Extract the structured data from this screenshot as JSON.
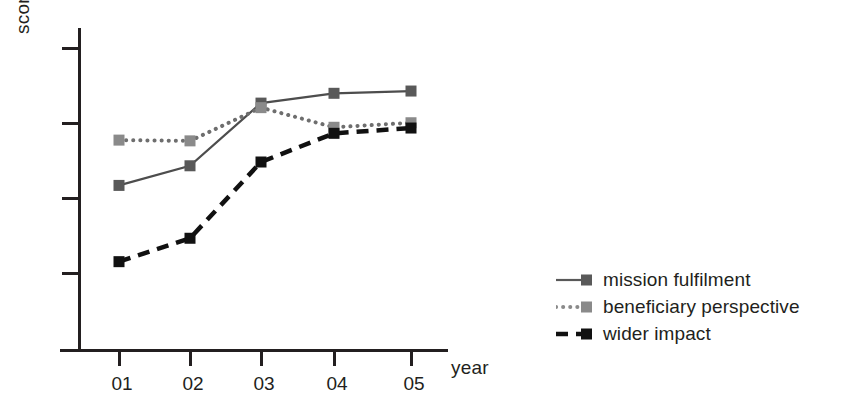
{
  "chart_data": {
    "type": "line",
    "title": "",
    "xlabel": "year",
    "ylabel": "score",
    "categories": [
      "01",
      "02",
      "03",
      "04",
      "05"
    ],
    "x": [
      1,
      2,
      3,
      4,
      5
    ],
    "ylim": [
      0,
      4
    ],
    "xlim": [
      0.5,
      5.6
    ],
    "grid": false,
    "y_ticks_labeled": false,
    "y_tick_count": 4,
    "legend_position": "right",
    "series": [
      {
        "name": "mission fulfilment",
        "values": [
          2.18,
          2.44,
          3.27,
          3.4,
          3.43
        ],
        "color": "#4d4d4d",
        "marker_color": "#595959",
        "line_style": "solid"
      },
      {
        "name": "beneficiary perspective",
        "values": [
          2.78,
          2.77,
          3.21,
          2.95,
          3.01
        ],
        "color": "#6e6e6e",
        "marker_color": "#8a8a8a",
        "line_style": "dotted"
      },
      {
        "name": "wider impact",
        "values": [
          1.17,
          1.48,
          2.49,
          2.87,
          2.94
        ],
        "color": "#111111",
        "marker_color": "#111111",
        "line_style": "dashed"
      }
    ]
  },
  "axes": {
    "y_title": "score",
    "x_title": "year",
    "x_tick_labels": [
      "01",
      "02",
      "03",
      "04",
      "05"
    ],
    "axis_color": "#231f20"
  },
  "legend": {
    "items": [
      {
        "label": "mission fulfilment",
        "line_style": "solid",
        "swatch_color": "#595959"
      },
      {
        "label": "beneficiary perspective",
        "line_style": "dotted",
        "swatch_color": "#8a8a8a"
      },
      {
        "label": "wider impact",
        "line_style": "dashed",
        "swatch_color": "#111111"
      }
    ]
  },
  "colors": {
    "background": "#ffffff",
    "foreground": "#231f20",
    "series_1": "#595959",
    "series_2": "#8a8a8a",
    "series_3": "#111111"
  }
}
